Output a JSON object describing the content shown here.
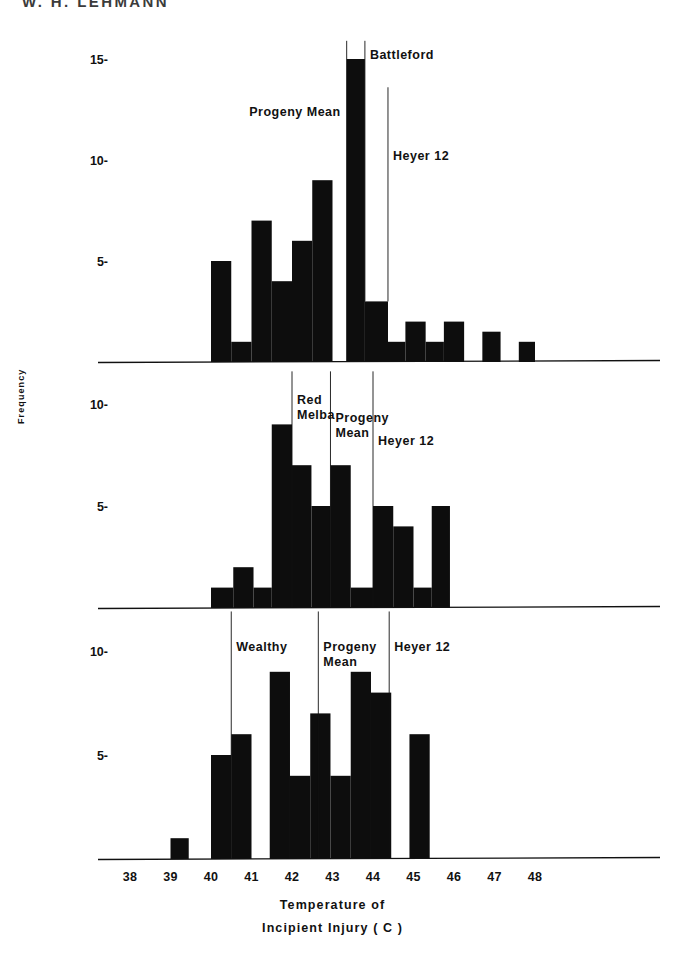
{
  "running_head": "W. H. LEHMANN",
  "axis": {
    "y_label": "Frequency",
    "x_caption_line1": "Temperature  of",
    "x_caption_line2": "Incipient Injury  ( C )",
    "x_ticks": [
      "38",
      "39",
      "40",
      "41",
      "42",
      "43",
      "44",
      "45",
      "46",
      "47",
      "48"
    ],
    "x_min": 38,
    "x_max": 48.6,
    "color": "#111111"
  },
  "panels": [
    {
      "id": "battleford-panel",
      "name": "Battleford",
      "y_ticks": [
        5,
        10,
        15
      ],
      "y_tick_labels": [
        "5-",
        "10-",
        "15-"
      ],
      "y_max": 15.9,
      "markers": [
        {
          "label": "Progeny Mean",
          "x": 43.35,
          "label_anchor": "end",
          "label_y_value": 12.2,
          "top_value": 15.9,
          "bottom_value": 0
        },
        {
          "label": "Battleford",
          "x": 43.8,
          "label_anchor": "start",
          "label_y_value": 15.0,
          "top_value": 15.9,
          "bottom_value": 3.0
        },
        {
          "label": "Heyer 12",
          "x": 44.37,
          "label_anchor": "start",
          "label_y_value": 10.0,
          "top_value": 13.6,
          "bottom_value": 3.0
        }
      ],
      "bars": [
        {
          "x0": 40.0,
          "x1": 40.5,
          "value": 5
        },
        {
          "x0": 40.5,
          "x1": 41.0,
          "value": 1
        },
        {
          "x0": 41.0,
          "x1": 41.5,
          "value": 7
        },
        {
          "x0": 41.5,
          "x1": 42.0,
          "value": 4
        },
        {
          "x0": 42.0,
          "x1": 42.5,
          "value": 6
        },
        {
          "x0": 42.5,
          "x1": 43.0,
          "value": 9
        },
        {
          "x0": 43.35,
          "x1": 43.8,
          "value": 15
        },
        {
          "x0": 43.8,
          "x1": 44.37,
          "value": 3
        },
        {
          "x0": 44.37,
          "x1": 44.8,
          "value": 1
        },
        {
          "x0": 44.8,
          "x1": 45.3,
          "value": 2
        },
        {
          "x0": 45.3,
          "x1": 45.75,
          "value": 1
        },
        {
          "x0": 45.75,
          "x1": 46.25,
          "value": 2
        },
        {
          "x0": 46.7,
          "x1": 47.15,
          "value": 1.5
        },
        {
          "x0": 47.6,
          "x1": 48.0,
          "value": 1
        }
      ]
    },
    {
      "id": "red-melba-panel",
      "name": "Red Melba",
      "y_ticks": [
        5,
        10
      ],
      "y_tick_labels": [
        "5-",
        "10-"
      ],
      "y_max": 11.6,
      "markers": [
        {
          "label": "Red\nMelba",
          "x": 42.0,
          "label_anchor": "start",
          "label_y_value": 10.0,
          "top_value": 11.6,
          "bottom_value": 0
        },
        {
          "label": "Progeny\nMean",
          "x": 42.95,
          "label_anchor": "start",
          "label_y_value": 9.1,
          "top_value": 11.6,
          "bottom_value": 0
        },
        {
          "label": "Heyer 12",
          "x": 44.0,
          "label_anchor": "start",
          "label_y_value": 8.0,
          "top_value": 11.6,
          "bottom_value": 0
        }
      ],
      "bars": [
        {
          "x0": 40.0,
          "x1": 40.55,
          "value": 1
        },
        {
          "x0": 40.55,
          "x1": 41.05,
          "value": 2
        },
        {
          "x0": 41.05,
          "x1": 41.5,
          "value": 1
        },
        {
          "x0": 41.5,
          "x1": 42.0,
          "value": 9
        },
        {
          "x0": 42.0,
          "x1": 42.48,
          "value": 7
        },
        {
          "x0": 42.48,
          "x1": 42.95,
          "value": 5
        },
        {
          "x0": 42.95,
          "x1": 43.45,
          "value": 7
        },
        {
          "x0": 43.45,
          "x1": 44.0,
          "value": 1
        },
        {
          "x0": 44.0,
          "x1": 44.5,
          "value": 5
        },
        {
          "x0": 44.5,
          "x1": 45.0,
          "value": 4
        },
        {
          "x0": 45.0,
          "x1": 45.45,
          "value": 1
        },
        {
          "x0": 45.45,
          "x1": 45.9,
          "value": 5
        }
      ]
    },
    {
      "id": "wealthy-panel",
      "name": "Wealthy",
      "y_ticks": [
        5,
        10
      ],
      "y_tick_labels": [
        "5-",
        "10-"
      ],
      "y_max": 11.9,
      "markers": [
        {
          "label": "Wealthy",
          "x": 40.5,
          "label_anchor": "start",
          "label_y_value": 10.0,
          "top_value": 11.9,
          "bottom_value": 0
        },
        {
          "label": "Progeny\nMean",
          "x": 42.65,
          "label_anchor": "start",
          "label_y_value": 10.0,
          "top_value": 11.9,
          "bottom_value": 0
        },
        {
          "label": "Heyer 12",
          "x": 44.4,
          "label_anchor": "start",
          "label_y_value": 10.0,
          "top_value": 11.9,
          "bottom_value": 0
        }
      ],
      "bars": [
        {
          "x0": 39.0,
          "x1": 39.45,
          "value": 1
        },
        {
          "x0": 40.0,
          "x1": 40.5,
          "value": 5
        },
        {
          "x0": 40.5,
          "x1": 41.0,
          "value": 6
        },
        {
          "x0": 41.45,
          "x1": 41.95,
          "value": 9
        },
        {
          "x0": 41.95,
          "x1": 42.45,
          "value": 4
        },
        {
          "x0": 42.45,
          "x1": 42.95,
          "value": 7
        },
        {
          "x0": 42.95,
          "x1": 43.45,
          "value": 4
        },
        {
          "x0": 43.45,
          "x1": 43.95,
          "value": 9
        },
        {
          "x0": 43.95,
          "x1": 44.45,
          "value": 8
        },
        {
          "x0": 44.9,
          "x1": 45.4,
          "value": 6
        }
      ]
    }
  ],
  "chart_data": {
    "type": "bar",
    "xlabel": "Temperature of Incipient Injury ( C )",
    "ylabel": "Frequency",
    "xlim": [
      38,
      48.6
    ],
    "grid": false,
    "legend": "none",
    "panel_count": 3,
    "x_tick_labels": [
      "38",
      "39",
      "40",
      "41",
      "42",
      "43",
      "44",
      "45",
      "46",
      "47",
      "48"
    ],
    "panels": [
      {
        "name": "Battleford",
        "ylim": [
          0,
          15.9
        ],
        "y_tick_labels": [
          "5",
          "10",
          "15"
        ],
        "bin_centers": [
          40.25,
          40.75,
          41.25,
          41.75,
          42.25,
          42.75,
          43.5,
          44.1,
          44.6,
          45.05,
          45.5,
          46.0,
          46.9,
          47.8
        ],
        "values": [
          5,
          1,
          7,
          4,
          6,
          9,
          15,
          3,
          1,
          2,
          1,
          2,
          1.5,
          1
        ],
        "annotations": [
          "Progeny Mean",
          "Battleford",
          "Heyer 12"
        ],
        "annotation_x": [
          43.35,
          43.8,
          44.37
        ]
      },
      {
        "name": "Red Melba",
        "ylim": [
          0,
          11.6
        ],
        "y_tick_labels": [
          "5",
          "10"
        ],
        "bin_centers": [
          40.25,
          40.8,
          41.25,
          41.75,
          42.25,
          42.7,
          43.2,
          43.7,
          44.25,
          44.75,
          45.2,
          45.7
        ],
        "values": [
          1,
          2,
          1,
          9,
          7,
          5,
          7,
          1,
          5,
          4,
          1,
          5
        ],
        "annotations": [
          "Red Melba",
          "Progeny Mean",
          "Heyer 12"
        ],
        "annotation_x": [
          42.0,
          42.95,
          44.0
        ]
      },
      {
        "name": "Wealthy",
        "ylim": [
          0,
          11.9
        ],
        "y_tick_labels": [
          "5",
          "10"
        ],
        "bin_centers": [
          39.2,
          40.25,
          40.75,
          41.7,
          42.2,
          42.7,
          43.2,
          43.7,
          44.2,
          45.15
        ],
        "values": [
          1,
          5,
          6,
          9,
          4,
          7,
          4,
          9,
          8,
          6
        ],
        "annotations": [
          "Wealthy",
          "Progeny Mean",
          "Heyer 12"
        ],
        "annotation_x": [
          40.5,
          42.65,
          44.4
        ]
      }
    ]
  }
}
